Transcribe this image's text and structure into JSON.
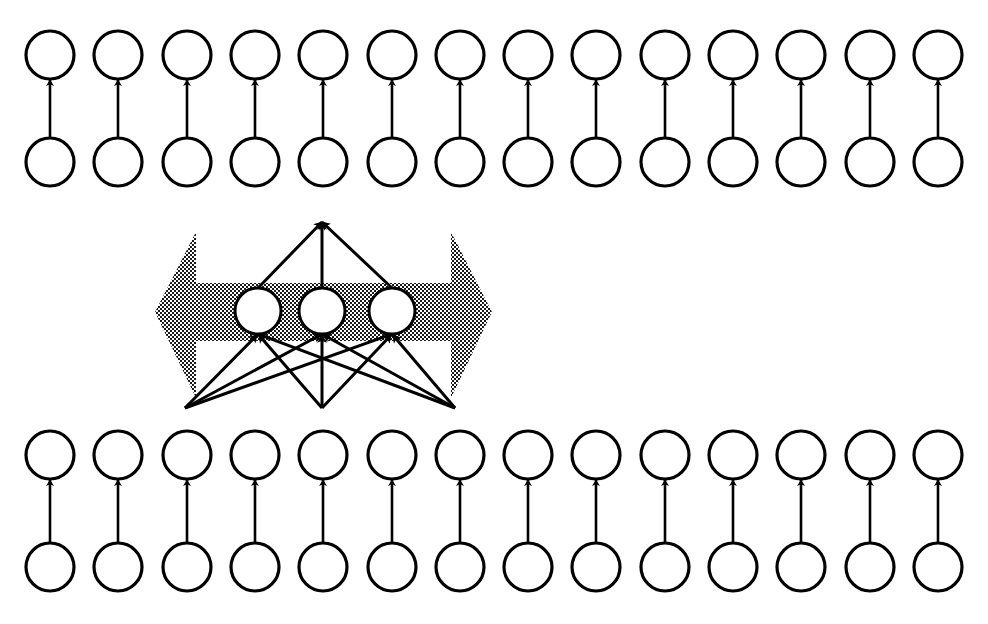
{
  "figure": {
    "width": 988,
    "height": 624,
    "background_color": "#ffffff",
    "stroke_color": "#000000",
    "node_fill_color": "#ffffff",
    "band_color": "#808080"
  },
  "style": {
    "node_stroke_width": 3.2,
    "middle_node_stroke_width": 3.0,
    "arrow_stroke_width": 2.6,
    "fan_arrow_stroke_width": 3.0,
    "halftone_pitch": 4,
    "halftone_dot": 2
  },
  "top_block": {
    "name": "top-node-block",
    "columns": 14,
    "first_center_x": 50,
    "column_spacing": 68.3,
    "upper_row_center_y": 55,
    "lower_row_center_y": 162,
    "node_radius": 24,
    "arrow_direction": "up",
    "arrow_tail_y": 138,
    "arrow_head_y": 80
  },
  "bottom_block": {
    "name": "bottom-node-block",
    "columns": 14,
    "first_center_x": 50,
    "column_spacing": 68.3,
    "upper_row_center_y": 455,
    "lower_row_center_y": 567,
    "node_radius": 24,
    "arrow_direction": "up",
    "arrow_tail_y": 543,
    "arrow_head_y": 480
  },
  "middle_layer": {
    "name": "hidden-layer",
    "node_count": 3,
    "node_radius": 23,
    "node_center_y": 311,
    "node_center_xs": [
      258,
      322,
      392
    ],
    "apex_x": 322,
    "apex_y": 222,
    "source_y": 408,
    "source_xs": [
      185,
      258,
      333,
      455
    ],
    "fan_source_xs": [
      185,
      322,
      455
    ],
    "connection_type": "fully-connected",
    "incoming_arrow_count": 9,
    "outgoing_arrow_count": 3
  },
  "band_arrow": {
    "name": "bidirectional-band-arrow",
    "direction": "both",
    "left_tip_x": 155,
    "right_tip_x": 492,
    "shaft_left_x": 196,
    "shaft_right_x": 451,
    "shaft_top_y": 283,
    "shaft_bottom_y": 341,
    "head_top_y": 232,
    "head_bottom_y": 398,
    "fill": "halftone-gray"
  }
}
